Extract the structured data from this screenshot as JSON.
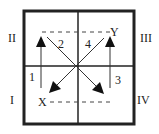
{
  "quadrants": {
    "top_left": "II",
    "top_right": "III",
    "bottom_left": "I",
    "bottom_right": "IV"
  },
  "points": {
    "x": "X",
    "y": "Y"
  },
  "arrows": [
    {
      "label": "1",
      "direction": "up",
      "quadrant": "I"
    },
    {
      "label": "2",
      "direction": "down-left",
      "quadrant": "II"
    },
    {
      "label": "3",
      "direction": "up",
      "quadrant": "IV"
    },
    {
      "label": "4",
      "direction": "down-right",
      "quadrant": "III"
    }
  ],
  "colors": {
    "line": "#222222",
    "background": "#ffffff"
  }
}
